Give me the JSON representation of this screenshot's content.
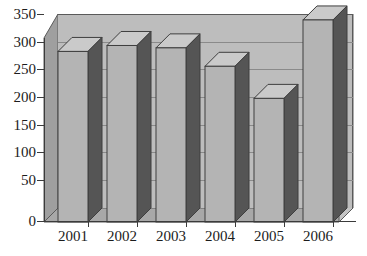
{
  "chart_data": {
    "type": "bar",
    "title": "",
    "subtitle": "",
    "xlabel": "",
    "ylabel": "",
    "categories": [
      "2001",
      "2002",
      "2003",
      "2004",
      "2005",
      "2006"
    ],
    "values": [
      287,
      297,
      293,
      262,
      208,
      340
    ],
    "series": [
      {
        "name": "",
        "values": [
          287,
          297,
          293,
          262,
          208,
          340
        ]
      }
    ],
    "ylim": [
      0,
      350
    ],
    "yticks": [
      0,
      50,
      100,
      150,
      200,
      250,
      300,
      350
    ],
    "ytick_labels": [
      "0",
      "50",
      "100",
      "150",
      "200",
      "250",
      "300",
      "350"
    ],
    "xtick_labels": [
      "2001",
      "2002",
      "2003",
      "2004",
      "2005",
      "2006"
    ],
    "grid": true,
    "grid_axis": "y",
    "legend": false,
    "legend_position": "none",
    "style": "3d-column",
    "colors": {
      "bar_front": "#b4b4b4",
      "bar_side": "#555555",
      "bar_top": "#cacaca",
      "bar_outline": "#4a4a4a",
      "plot_back_wall": "#bdbdbd",
      "plot_left_wall": "#9f9f9f",
      "plot_floor": "#a8a8a8",
      "gridline": "#8a8a8a",
      "axis": "#3b3b3b",
      "text": "#1c1c1c",
      "background": "#ffffff"
    },
    "annotations": []
  }
}
